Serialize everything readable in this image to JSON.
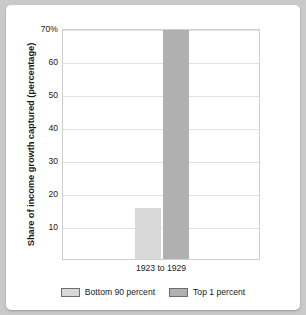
{
  "chart_data": {
    "type": "bar",
    "title": "",
    "xlabel": "",
    "ylabel": "Share of income growth captured (percentage)",
    "categories": [
      "1923 to 1929"
    ],
    "series": [
      {
        "name": "Bottom 90 percent",
        "values": [
          15.5
        ],
        "color": "#d8d8d8"
      },
      {
        "name": "Top 1 percent",
        "values": [
          69.5
        ],
        "color": "#b0b0b0"
      }
    ],
    "ylim": [
      0,
      70
    ],
    "yticks": [
      {
        "value": 70,
        "label": "70%"
      },
      {
        "value": 60,
        "label": "60"
      },
      {
        "value": 50,
        "label": "50"
      },
      {
        "value": 40,
        "label": "40"
      },
      {
        "value": 30,
        "label": "30"
      },
      {
        "value": 20,
        "label": "20"
      },
      {
        "value": 10,
        "label": "10"
      }
    ],
    "grid": true,
    "legend_position": "bottom"
  },
  "legend": {
    "entries": [
      {
        "label": "Bottom 90 percent"
      },
      {
        "label": "Top 1 percent"
      }
    ]
  },
  "colors": {
    "bottom90": "#d8d8d8",
    "top1": "#b0b0b0",
    "gridline": "#e2e2e2",
    "frame": "#cfcfcf",
    "page_background": "#c9c9c9",
    "card_background": "#ffffff",
    "text": "#1a1a1a"
  }
}
